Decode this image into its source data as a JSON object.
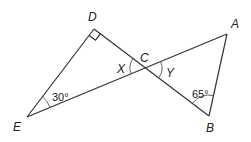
{
  "diagram": {
    "type": "geometry",
    "points": {
      "D": {
        "label": "D",
        "x": 94,
        "y": 29
      },
      "A": {
        "label": "A",
        "x": 227,
        "y": 34
      },
      "B": {
        "label": "B",
        "x": 209,
        "y": 116
      },
      "E": {
        "label": "E",
        "x": 27,
        "y": 117
      },
      "C": {
        "label": "C",
        "x": 146,
        "y": 68
      }
    },
    "segments": [
      [
        "D",
        "E"
      ],
      [
        "D",
        "B"
      ],
      [
        "E",
        "A"
      ],
      [
        "A",
        "B"
      ]
    ],
    "angles": {
      "E": {
        "value": "30°"
      },
      "B": {
        "value": "65°"
      },
      "D": {
        "value": "right-angle"
      },
      "X": {
        "label": "X"
      },
      "Y": {
        "label": "Y"
      }
    }
  }
}
